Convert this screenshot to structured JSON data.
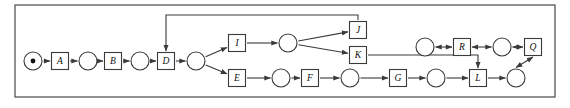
{
  "diagram": {
    "type": "petri-net",
    "canvas": {
      "width": 570,
      "height": 108
    },
    "frame": {
      "x": 15,
      "y": 5,
      "width": 540,
      "height": 92,
      "stroke": "#3a3a3a"
    },
    "style": {
      "line_color": "#3a3a3a",
      "node_stroke": "#3a3a3a",
      "node_fill": "#ffffff",
      "label_color": "#111111",
      "token_color": "#111111",
      "place_radius": 9,
      "transition_size": 17,
      "stroke_width": 1.1
    },
    "lanes": {
      "feedback": 15,
      "upper_branch": 30,
      "top": 43,
      "r_row": 47,
      "middle": 61,
      "bottom": 78
    },
    "transitions": [
      {
        "id": "A",
        "label": "A",
        "x": 60,
        "y": 61
      },
      {
        "id": "B",
        "label": "B",
        "x": 113,
        "y": 61
      },
      {
        "id": "D",
        "label": "D",
        "x": 166,
        "y": 61
      },
      {
        "id": "I",
        "label": "I",
        "x": 237,
        "y": 43
      },
      {
        "id": "E",
        "label": "E",
        "x": 237,
        "y": 78
      },
      {
        "id": "J",
        "label": "J",
        "x": 358,
        "y": 30
      },
      {
        "id": "K",
        "label": "K",
        "x": 358,
        "y": 55
      },
      {
        "id": "F",
        "label": "F",
        "x": 310,
        "y": 78
      },
      {
        "id": "G",
        "label": "G",
        "x": 398,
        "y": 78
      },
      {
        "id": "L",
        "label": "L",
        "x": 478,
        "y": 78
      },
      {
        "id": "R",
        "label": "R",
        "x": 462,
        "y": 47
      },
      {
        "id": "Q",
        "label": "Q",
        "x": 533,
        "y": 47
      }
    ],
    "places": [
      {
        "id": "p0",
        "x": 33,
        "y": 61,
        "token": true,
        "token_count": 1
      },
      {
        "id": "p1",
        "x": 88,
        "y": 61,
        "token": false
      },
      {
        "id": "p2",
        "x": 140,
        "y": 61,
        "token": false
      },
      {
        "id": "p3",
        "x": 196,
        "y": 61,
        "token": false
      },
      {
        "id": "p4",
        "x": 288,
        "y": 43,
        "token": false
      },
      {
        "id": "p5",
        "x": 281,
        "y": 78,
        "token": false
      },
      {
        "id": "p6",
        "x": 350,
        "y": 78,
        "token": false
      },
      {
        "id": "p7",
        "x": 436,
        "y": 78,
        "token": false
      },
      {
        "id": "p8",
        "x": 516,
        "y": 78,
        "token": false
      },
      {
        "id": "p9",
        "x": 425,
        "y": 47,
        "token": false
      },
      {
        "id": "p10",
        "x": 502,
        "y": 47,
        "token": false
      }
    ],
    "arcs": [
      {
        "from": "p0",
        "to": "A",
        "kind": "straight",
        "direction": "forward"
      },
      {
        "from": "A",
        "to": "p1",
        "kind": "straight",
        "direction": "forward"
      },
      {
        "from": "p1",
        "to": "B",
        "kind": "straight",
        "direction": "forward"
      },
      {
        "from": "B",
        "to": "p2",
        "kind": "straight",
        "direction": "forward"
      },
      {
        "from": "p2",
        "to": "D",
        "kind": "straight",
        "direction": "forward"
      },
      {
        "from": "D",
        "to": "p3",
        "kind": "straight",
        "direction": "forward"
      },
      {
        "from": "p3",
        "to": "I",
        "kind": "diagonal",
        "direction": "forward"
      },
      {
        "from": "p3",
        "to": "E",
        "kind": "diagonal",
        "direction": "forward"
      },
      {
        "from": "I",
        "to": "p4",
        "kind": "straight",
        "direction": "forward"
      },
      {
        "from": "p4",
        "to": "J",
        "kind": "diagonal",
        "direction": "forward"
      },
      {
        "from": "p4",
        "to": "K",
        "kind": "diagonal",
        "direction": "forward"
      },
      {
        "from": "J",
        "to": "D",
        "kind": "feedback-top",
        "direction": "forward"
      },
      {
        "from": "K",
        "to": "L",
        "kind": "elbow-down",
        "direction": "forward"
      },
      {
        "from": "E",
        "to": "p5",
        "kind": "straight",
        "direction": "forward"
      },
      {
        "from": "p5",
        "to": "F",
        "kind": "straight",
        "direction": "forward"
      },
      {
        "from": "F",
        "to": "p6",
        "kind": "straight",
        "direction": "forward"
      },
      {
        "from": "p6",
        "to": "G",
        "kind": "straight",
        "direction": "forward"
      },
      {
        "from": "G",
        "to": "p7",
        "kind": "straight",
        "direction": "forward"
      },
      {
        "from": "p7",
        "to": "L",
        "kind": "straight",
        "direction": "forward"
      },
      {
        "from": "L",
        "to": "p8",
        "kind": "straight",
        "direction": "forward"
      },
      {
        "from": "p8",
        "to": "Q",
        "kind": "vertical",
        "direction": "bidirectional"
      },
      {
        "from": "Q",
        "to": "p10",
        "kind": "straight",
        "direction": "bidirectional"
      },
      {
        "from": "p10",
        "to": "R",
        "kind": "straight",
        "direction": "bidirectional"
      },
      {
        "from": "R",
        "to": "p9",
        "kind": "straight",
        "direction": "bidirectional"
      }
    ]
  }
}
